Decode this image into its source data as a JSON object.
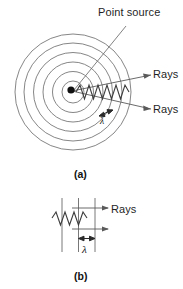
{
  "figure": {
    "title_visible": false,
    "panels": [
      {
        "id": "a",
        "caption": "(a)",
        "description": "Concentric circular wavefronts spreading from a point source, with two rays and wavelength marker",
        "labels": {
          "point_source": "Point source",
          "rays_upper": "Rays",
          "rays_lower": "Rays",
          "wavelength_symbol": "λ"
        },
        "wavefront_count": 6
      },
      {
        "id": "b",
        "caption": "(b)",
        "description": "Plane wavefronts with parallel rays and wavelength spacing",
        "labels": {
          "rays": "Rays",
          "wavelength_symbol": "λ"
        },
        "wavefront_count": 3
      }
    ]
  },
  "colors": {
    "line": "#6f6f6f",
    "ink": "#1a1a1a",
    "background": "#ffffff"
  }
}
